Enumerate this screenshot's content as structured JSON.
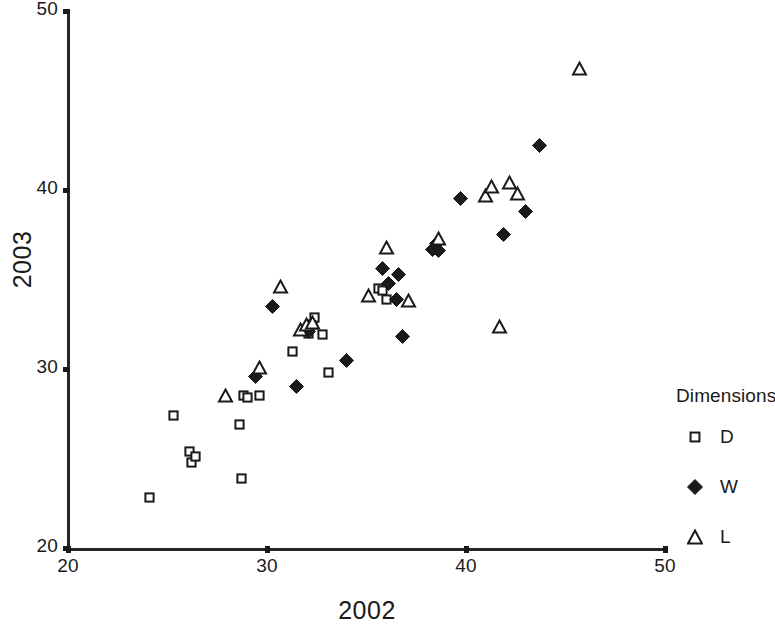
{
  "chart_data": {
    "type": "scatter",
    "title": "",
    "xlabel": "2002",
    "ylabel": "2003",
    "xlim": [
      20,
      50
    ],
    "ylim": [
      20,
      50
    ],
    "xticks": [
      20,
      30,
      40,
      50
    ],
    "yticks": [
      20,
      30,
      40,
      50
    ],
    "xtick_labels": [
      "20",
      "30",
      "40",
      "50"
    ],
    "ytick_labels": [
      "20",
      "30",
      "40",
      "50"
    ],
    "grid": false,
    "legend_position": "right",
    "legend_title": "Dimensions",
    "series": [
      {
        "name": "D",
        "marker": "open-square",
        "color": "#1a1a1a",
        "points": [
          [
            24.1,
            22.8
          ],
          [
            25.3,
            27.4
          ],
          [
            26.1,
            25.4
          ],
          [
            26.2,
            24.8
          ],
          [
            26.4,
            25.1
          ],
          [
            28.6,
            26.9
          ],
          [
            28.7,
            23.9
          ],
          [
            28.8,
            28.5
          ],
          [
            29.0,
            28.4
          ],
          [
            29.6,
            28.5
          ],
          [
            31.3,
            31.0
          ],
          [
            32.1,
            32.0
          ],
          [
            32.3,
            32.5
          ],
          [
            32.4,
            32.9
          ],
          [
            32.8,
            31.9
          ],
          [
            33.1,
            29.8
          ],
          [
            35.6,
            34.5
          ],
          [
            35.8,
            34.4
          ],
          [
            36.0,
            33.9
          ]
        ]
      },
      {
        "name": "W",
        "marker": "filled-diamond",
        "color": "#1a1a1a",
        "points": [
          [
            29.4,
            29.6
          ],
          [
            30.3,
            33.5
          ],
          [
            31.5,
            29.0
          ],
          [
            32.1,
            32.1
          ],
          [
            34.0,
            30.5
          ],
          [
            35.8,
            35.6
          ],
          [
            36.1,
            34.8
          ],
          [
            36.5,
            33.9
          ],
          [
            36.6,
            35.3
          ],
          [
            36.8,
            31.8
          ],
          [
            38.3,
            36.7
          ],
          [
            38.5,
            37.0
          ],
          [
            38.6,
            36.6
          ],
          [
            39.7,
            39.5
          ],
          [
            41.9,
            37.5
          ],
          [
            43.0,
            38.8
          ],
          [
            43.7,
            42.5
          ]
        ]
      },
      {
        "name": "L",
        "marker": "open-triangle",
        "color": "#1a1a1a",
        "points": [
          [
            27.9,
            28.5
          ],
          [
            29.6,
            30.1
          ],
          [
            30.7,
            34.6
          ],
          [
            31.7,
            32.2
          ],
          [
            32.0,
            32.5
          ],
          [
            32.3,
            32.6
          ],
          [
            35.1,
            34.1
          ],
          [
            36.0,
            36.8
          ],
          [
            37.1,
            33.8
          ],
          [
            38.6,
            37.3
          ],
          [
            41.0,
            39.7
          ],
          [
            41.3,
            40.2
          ],
          [
            41.7,
            32.4
          ],
          [
            42.2,
            40.4
          ],
          [
            42.6,
            39.8
          ],
          [
            45.7,
            46.8
          ]
        ]
      }
    ]
  },
  "axes": {
    "x_title": "2002",
    "y_title": "2003",
    "x_ticks": [
      "20",
      "30",
      "40",
      "50"
    ],
    "y_ticks": [
      "20",
      "30",
      "40",
      "50"
    ]
  },
  "legend": {
    "title": "Dimensions",
    "entries": [
      {
        "label": "D",
        "marker": "open-square"
      },
      {
        "label": "W",
        "marker": "filled-diamond"
      },
      {
        "label": "L",
        "marker": "open-triangle"
      }
    ]
  },
  "style": {
    "ink": "#1a1a1a",
    "background": "#ffffff"
  }
}
